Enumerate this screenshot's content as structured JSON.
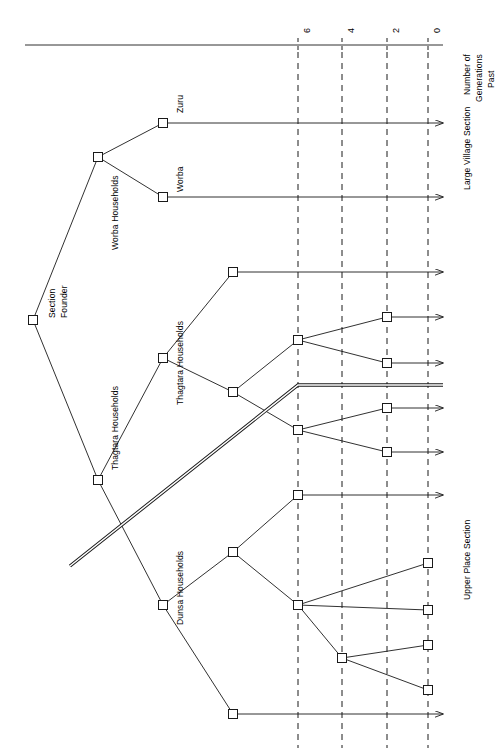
{
  "figure": {
    "type": "genealogical-segmentation-diagram",
    "orientation": "rotated-90-counterclockwise",
    "background_color": "#ffffff",
    "line_color": "#1a1a1a"
  },
  "axis": {
    "title_line1": "Number of",
    "title_line2": "Generations",
    "title_line3": "Past",
    "ticks": [
      {
        "label": "6",
        "x": 298
      },
      {
        "label": "4",
        "x": 342
      },
      {
        "label": "2",
        "x": 387
      },
      {
        "label": "0",
        "x": 428
      }
    ],
    "axis_line": {
      "x1": 25,
      "y1": 45,
      "x2": 443,
      "y2": 45
    },
    "gridline_style": "dashed",
    "gridline_top": 52,
    "gridline_bottom": 748
  },
  "sections": [
    {
      "id": "large-village-section",
      "label": "Large Village Section",
      "x": 462,
      "y": 190
    },
    {
      "id": "upper-place-section",
      "label": "Upper Place Section",
      "x": 462,
      "y": 600
    }
  ],
  "divider": {
    "name": "section-divider",
    "style": "double-line",
    "points": "70,566 298,385 443,385"
  },
  "node_labels": [
    {
      "id": "section-founder",
      "line1": "Section",
      "line2": "Founder",
      "x": 47,
      "y": 318
    },
    {
      "id": "worba-households",
      "text": "Worba Households",
      "x": 110,
      "y": 250
    },
    {
      "id": "zuru",
      "text": "Zuru",
      "x": 175,
      "y": 113
    },
    {
      "id": "worba",
      "text": "Worba",
      "x": 175,
      "y": 192
    },
    {
      "id": "thagtara-households-1",
      "text": "Thagtara Households",
      "x": 110,
      "y": 470
    },
    {
      "id": "thagtara-households-2",
      "text": "Thagtara Households",
      "x": 175,
      "y": 405
    },
    {
      "id": "dunsa-households",
      "text": "Dunsa Households",
      "x": 175,
      "y": 625
    }
  ],
  "nodes": [
    {
      "id": "n-founder",
      "name": "node-section-founder",
      "x": 33,
      "y": 320
    },
    {
      "id": "n-worba-hh",
      "name": "node-worba-households",
      "x": 98,
      "y": 157
    },
    {
      "id": "n-zuru",
      "name": "node-zuru",
      "x": 163,
      "y": 123
    },
    {
      "id": "n-worba",
      "name": "node-worba",
      "x": 163,
      "y": 197
    },
    {
      "id": "n-thagtara-hh",
      "name": "node-thagtara-households",
      "x": 98,
      "y": 480
    },
    {
      "id": "n-thag-b",
      "name": "node-thagtara-branch",
      "x": 163,
      "y": 358
    },
    {
      "id": "n-thag-top",
      "name": "node-thagtara-top",
      "x": 233,
      "y": 272
    },
    {
      "id": "n-thag-c",
      "name": "node-thagtara-mid",
      "x": 233,
      "y": 392
    },
    {
      "id": "n-thag-g6a",
      "name": "node-thagtara-gen6-upper",
      "x": 298,
      "y": 340
    },
    {
      "id": "n-thag-g6b",
      "name": "node-thagtara-gen6-lower",
      "x": 298,
      "y": 430
    },
    {
      "id": "n-thag-g2a",
      "name": "node-thagtara-gen2-a",
      "x": 387,
      "y": 317
    },
    {
      "id": "n-thag-g2b",
      "name": "node-thagtara-gen2-b",
      "x": 387,
      "y": 363
    },
    {
      "id": "n-thag-g2c",
      "name": "node-thagtara-gen2-c",
      "x": 387,
      "y": 408
    },
    {
      "id": "n-thag-g2d",
      "name": "node-thagtara-gen2-d",
      "x": 387,
      "y": 452
    },
    {
      "id": "n-dunsa-hh",
      "name": "node-dunsa-households",
      "x": 163,
      "y": 605
    },
    {
      "id": "n-dunsa-b",
      "name": "node-dunsa-branch",
      "x": 233,
      "y": 552
    },
    {
      "id": "n-dunsa-top",
      "name": "node-dunsa-top",
      "x": 298,
      "y": 495
    },
    {
      "id": "n-dunsa-c",
      "name": "node-dunsa-mid",
      "x": 298,
      "y": 605
    },
    {
      "id": "n-dunsa-d",
      "name": "node-dunsa-lower",
      "x": 342,
      "y": 658
    },
    {
      "id": "n-dunsa-bot",
      "name": "node-dunsa-bottom",
      "x": 233,
      "y": 714
    },
    {
      "id": "n-g0a",
      "name": "node-gen0-a",
      "x": 428,
      "y": 563
    },
    {
      "id": "n-g0b",
      "name": "node-gen0-b",
      "x": 428,
      "y": 610
    },
    {
      "id": "n-g0c",
      "name": "node-gen0-c",
      "x": 428,
      "y": 645
    },
    {
      "id": "n-g0d",
      "name": "node-gen0-d",
      "x": 428,
      "y": 690
    }
  ],
  "edges": [
    {
      "name": "edge-founder-to-worba-hh",
      "path": "33,320 98,157"
    },
    {
      "name": "edge-founder-to-thagtara-hh",
      "path": "33,320 98,480"
    },
    {
      "name": "edge-worba-hh-to-zuru",
      "path": "98,157 163,123"
    },
    {
      "name": "edge-worba-hh-to-worba",
      "path": "98,157 163,197"
    },
    {
      "name": "edge-thagtara-hh-to-branch",
      "path": "98,480 163,358"
    },
    {
      "name": "edge-thagtara-hh-to-dunsa-hh",
      "path": "98,480 163,605"
    },
    {
      "name": "edge-thag-branch-to-top",
      "path": "163,358 233,272"
    },
    {
      "name": "edge-thag-branch-to-mid",
      "path": "163,358 233,392"
    },
    {
      "name": "edge-thag-mid-to-gen6-upper",
      "path": "233,392 298,340"
    },
    {
      "name": "edge-thag-mid-to-gen6-lower",
      "path": "233,392 298,430"
    },
    {
      "name": "edge-gen6-upper-to-g2a",
      "path": "298,340 387,317"
    },
    {
      "name": "edge-gen6-upper-to-g2b",
      "path": "298,340 387,363"
    },
    {
      "name": "edge-gen6-lower-to-g2c",
      "path": "298,430 387,408"
    },
    {
      "name": "edge-gen6-lower-to-g2d",
      "path": "298,430 387,452"
    },
    {
      "name": "edge-dunsa-hh-to-branch",
      "path": "163,605 233,552"
    },
    {
      "name": "edge-dunsa-hh-to-bottom",
      "path": "163,605 233,714"
    },
    {
      "name": "edge-dunsa-branch-to-top",
      "path": "233,552 298,495"
    },
    {
      "name": "edge-dunsa-branch-to-mid",
      "path": "233,552 298,605"
    },
    {
      "name": "edge-dunsa-mid-to-g0a",
      "path": "298,605 428,563"
    },
    {
      "name": "edge-dunsa-mid-to-lower",
      "path": "298,605 342,658"
    },
    {
      "name": "edge-dunsa-mid-to-g0b",
      "path": "298,605 428,610"
    },
    {
      "name": "edge-dunsa-lower-to-g0c",
      "path": "342,658 428,645"
    },
    {
      "name": "edge-dunsa-lower-to-g0d",
      "path": "342,658 428,690"
    }
  ],
  "arrow_lines": [
    {
      "name": "arrow-zuru-to-present",
      "x1": 163,
      "y1": 123,
      "x2": 443,
      "y2": 123
    },
    {
      "name": "arrow-worba-to-present",
      "x1": 163,
      "y1": 197,
      "x2": 443,
      "y2": 197
    },
    {
      "name": "arrow-thagtara-top-to-present",
      "x1": 233,
      "y1": 272,
      "x2": 443,
      "y2": 272
    },
    {
      "name": "arrow-thagtara-g2a-to-present",
      "x1": 387,
      "y1": 317,
      "x2": 443,
      "y2": 317
    },
    {
      "name": "arrow-thagtara-g2b-to-present",
      "x1": 387,
      "y1": 363,
      "x2": 443,
      "y2": 363
    },
    {
      "name": "arrow-thagtara-g2c-to-present",
      "x1": 387,
      "y1": 408,
      "x2": 443,
      "y2": 408
    },
    {
      "name": "arrow-thagtara-g2d-to-present",
      "x1": 387,
      "y1": 452,
      "x2": 443,
      "y2": 452
    },
    {
      "name": "arrow-dunsa-top-to-present",
      "x1": 298,
      "y1": 495,
      "x2": 443,
      "y2": 495
    },
    {
      "name": "arrow-dunsa-bottom-to-present",
      "x1": 233,
      "y1": 714,
      "x2": 443,
      "y2": 714
    }
  ]
}
